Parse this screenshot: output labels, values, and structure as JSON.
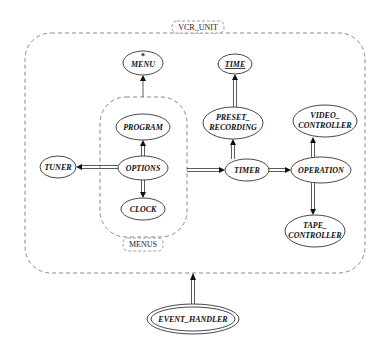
{
  "clusters": {
    "vcr_unit": {
      "label": "VCR_UNIT"
    },
    "menus": {
      "label": "MENUS"
    }
  },
  "nodes": {
    "menu": {
      "label": "MENU",
      "marker": "*"
    },
    "time": {
      "label": "TIME",
      "underlined": true
    },
    "program": {
      "label": "PROGRAM"
    },
    "options": {
      "label": "OPTIONS"
    },
    "clock": {
      "label": "CLOCK"
    },
    "tuner": {
      "label": "TUNER"
    },
    "preset_recording": {
      "label_line1": "PRESET_",
      "label_line2": "RECORDING"
    },
    "timer": {
      "label": "TIMER"
    },
    "video_controller": {
      "label_line1": "VIDEO_",
      "label_line2": "CONTROLLER"
    },
    "operation": {
      "label": "OPERATION"
    },
    "tape_controller": {
      "label_line1": "TAPE_",
      "label_line2": "CONTROLLER"
    },
    "event_handler": {
      "label": "EVENT_HANDLER"
    }
  },
  "edges": [
    {
      "from": "MENUS",
      "to": "MENU",
      "style": "single"
    },
    {
      "from": "OPTIONS",
      "to": "PROGRAM",
      "style": "double"
    },
    {
      "from": "OPTIONS",
      "to": "CLOCK",
      "style": "double"
    },
    {
      "from": "OPTIONS",
      "to": "TUNER",
      "style": "double"
    },
    {
      "from": "MENUS",
      "to": "TIMER",
      "style": "double"
    },
    {
      "from": "TIMER",
      "to": "PRESET_RECORDING",
      "style": "double"
    },
    {
      "from": "PRESET_RECORDING",
      "to": "TIME",
      "style": "double"
    },
    {
      "from": "TIMER",
      "to": "OPERATION",
      "style": "double"
    },
    {
      "from": "OPERATION",
      "to": "VIDEO_CONTROLLER",
      "style": "double"
    },
    {
      "from": "OPERATION",
      "to": "TAPE_CONTROLLER",
      "style": "double"
    },
    {
      "from": "EVENT_HANDLER",
      "to": "VCR_UNIT",
      "style": "double"
    }
  ]
}
